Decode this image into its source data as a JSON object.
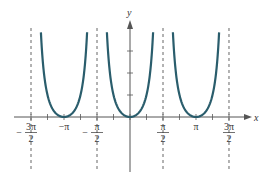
{
  "chart_data": {
    "type": "line",
    "function": "y = tan^2(x)",
    "title": "",
    "xlabel": "x",
    "ylabel": "y",
    "x_ticks": [
      {
        "value": -4.712,
        "num": "3π",
        "den": "2",
        "sign": "−"
      },
      {
        "value": -3.1416,
        "label": "−π"
      },
      {
        "value": -1.5708,
        "num": "π",
        "den": "2",
        "sign": "−"
      },
      {
        "value": 1.5708,
        "num": "π",
        "den": "2",
        "sign": ""
      },
      {
        "value": 3.1416,
        "label": "π"
      },
      {
        "value": 4.712,
        "num": "3π",
        "den": "2",
        "sign": ""
      }
    ],
    "asymptotes": [
      -4.712,
      -1.5708,
      1.5708,
      4.712
    ],
    "minima": [
      [
        -3.1416,
        0
      ],
      [
        0,
        0
      ],
      [
        3.1416,
        0
      ]
    ],
    "y_ticks": [
      1,
      2,
      3
    ],
    "xlim": [
      -5.0,
      5.3
    ],
    "ylim": [
      0,
      3.8
    ],
    "grid": false,
    "legend": null,
    "colors": {
      "curve": "#2a5d6c",
      "axis": "#555555",
      "asymptote": "#555555"
    }
  }
}
